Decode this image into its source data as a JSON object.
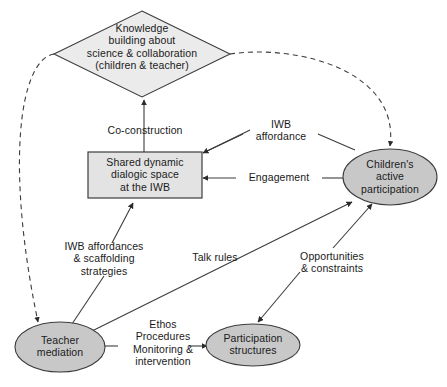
{
  "diagram": {
    "canvas": {
      "width": 447,
      "height": 387,
      "background": "#ffffff"
    },
    "colors": {
      "diamond_fill": "#ebebeb",
      "rect_fill": "#e3e3e3",
      "ellipse_fill": "#c8c8c8",
      "stroke": "#3c3c3c",
      "text": "#1a1a1a"
    },
    "nodes": [
      {
        "id": "knowledge-building",
        "shape": "diamond",
        "label": "Knowledge\nbuilding about\nscience & collaboration\n(children & teacher)",
        "cx": 142,
        "cy": 54,
        "rx": 88,
        "ry": 43
      },
      {
        "id": "shared-dialogic-space",
        "shape": "rectangle",
        "label": "Shared dynamic\ndialogic space\nat the IWB",
        "x": 88,
        "y": 152,
        "w": 112,
        "h": 46
      },
      {
        "id": "childrens-active-participation",
        "shape": "ellipse",
        "label": "Children's\nactive\nparticipation",
        "cx": 390,
        "cy": 177,
        "rx": 47,
        "ry": 28
      },
      {
        "id": "teacher-mediation",
        "shape": "ellipse",
        "label": "Teacher\nmediation",
        "cx": 60,
        "cy": 347,
        "rx": 45,
        "ry": 25
      },
      {
        "id": "participation-structures",
        "shape": "ellipse",
        "label": "Participation\nstructures",
        "cx": 253,
        "cy": 345,
        "rx": 47,
        "ry": 21
      }
    ],
    "edge_labels": [
      {
        "id": "co-construction",
        "text": "Co-construction",
        "x": 100,
        "y": 124,
        "w": 90
      },
      {
        "id": "iwb-affordance",
        "text": "IWB\naffordance",
        "x": 245,
        "y": 118,
        "w": 72
      },
      {
        "id": "engagement",
        "text": "Engagement",
        "x": 238,
        "y": 168,
        "w": 82
      },
      {
        "id": "iwb-affordances-scaffolding",
        "text": "IWB affordances\n& scaffolding\nstrategies",
        "x": 50,
        "y": 238,
        "w": 110
      },
      {
        "id": "talk-rules",
        "text": "Talk rules",
        "x": 182,
        "y": 250,
        "w": 68
      },
      {
        "id": "opportunities-constraints",
        "text": "Opportunities\n& constraints",
        "x": 288,
        "y": 252,
        "w": 90
      },
      {
        "id": "ethos-procedures",
        "text": "Ethos\nProcedures\nMonitoring &\nintervention",
        "x": 122,
        "y": 318,
        "w": 82
      }
    ],
    "edges": [
      {
        "id": "shared-to-knowledge",
        "from": "shared-dialogic-space",
        "to": "knowledge-building",
        "label": "Co-construction",
        "style": "solid"
      },
      {
        "id": "children-to-shared-affordance",
        "from": "childrens-active-participation",
        "to": "shared-dialogic-space",
        "label": "IWB affordance",
        "style": "solid"
      },
      {
        "id": "children-to-shared-engagement",
        "from": "childrens-active-participation",
        "to": "shared-dialogic-space",
        "label": "Engagement",
        "style": "solid"
      },
      {
        "id": "teacher-to-shared",
        "from": "teacher-mediation",
        "to": "shared-dialogic-space",
        "label": "IWB affordances & scaffolding strategies",
        "style": "solid"
      },
      {
        "id": "teacher-to-children",
        "from": "teacher-mediation",
        "to": "childrens-active-participation",
        "label": "Talk rules",
        "style": "solid"
      },
      {
        "id": "teacher-to-participation",
        "from": "teacher-mediation",
        "to": "participation-structures",
        "label": "Ethos Procedures Monitoring & intervention",
        "style": "solid"
      },
      {
        "id": "participation-to-children",
        "from": "participation-structures",
        "to": "childrens-active-participation",
        "label": "Opportunities & constraints",
        "style": "solid"
      },
      {
        "id": "opportunities-to-participation",
        "from": "opportunities-constraints",
        "to": "participation-structures",
        "label": "Opportunities & constraints",
        "style": "solid"
      },
      {
        "id": "knowledge-to-teacher",
        "from": "knowledge-building",
        "to": "teacher-mediation",
        "label": "",
        "style": "dashed"
      },
      {
        "id": "knowledge-to-children",
        "from": "knowledge-building",
        "to": "childrens-active-participation",
        "label": "",
        "style": "dashed"
      }
    ]
  }
}
